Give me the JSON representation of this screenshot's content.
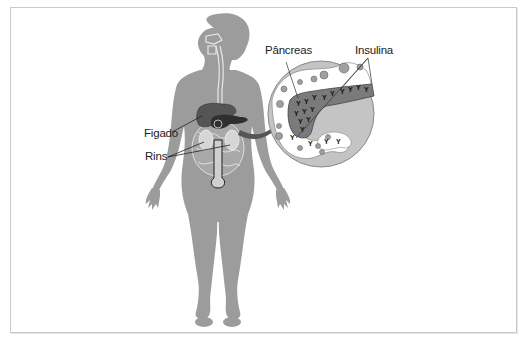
{
  "diagram": {
    "labels": {
      "liver": "Figado",
      "kidneys": "Rins",
      "pancreas": "Pâncreas",
      "insulin": "Insulina"
    },
    "colors": {
      "body": "#9c9c9c",
      "organ_dark": "#555555",
      "organ_light": "#c9c9c9",
      "zoom_circle": "#c4c4c4",
      "pancreas_fill": "#7a7a7a",
      "arrow": "#555555",
      "text": "#222222",
      "frame": "#c8c8c8"
    }
  }
}
